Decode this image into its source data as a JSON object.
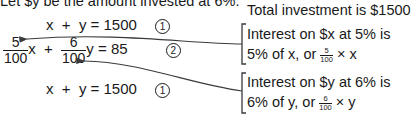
{
  "intro_line": "Let $y be the amount invested at 6%.",
  "equations": {
    "eq1_top": {
      "lhs": "x  +  y = 1500",
      "label": "1"
    },
    "eq2": {
      "frac1": {
        "num": "5",
        "den": "100"
      },
      "var1": "x",
      "plus": "+",
      "frac2": {
        "num": "6",
        "den": "100"
      },
      "var2": "y",
      "rhs": " = 85",
      "label": "2"
    },
    "eq1_bottom": {
      "lhs": "x  +  y = 1500",
      "label": "1"
    }
  },
  "annotations": {
    "total": "Total investment is $1500",
    "interest_x": {
      "line1": "Interest on $x at 5% is",
      "line2_prefix": "5% of x, or ",
      "frac": {
        "num": "5",
        "den": "100"
      },
      "line2_suffix": " × x"
    },
    "interest_y": {
      "line1": "Interest on $y at 6% is",
      "line2_prefix": "6% of y, or ",
      "frac": {
        "num": "6",
        "den": "100"
      },
      "line2_suffix": " × y"
    }
  },
  "colors": {
    "text": "#1a1a1a",
    "arrow": "#3a3a3a",
    "background": "#ffffff"
  }
}
